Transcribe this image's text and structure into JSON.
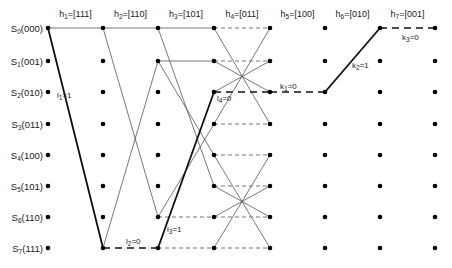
{
  "diagram": {
    "type": "trellis",
    "layout": {
      "columns_x": [
        48,
        103,
        158,
        214,
        270,
        325,
        380,
        435
      ],
      "rows_y": [
        28,
        61,
        92,
        124,
        155,
        186,
        217,
        248
      ],
      "stage_label_y": 14
    },
    "states": [
      {
        "sub": "0",
        "label_prefix": "S",
        "bits": "(000)"
      },
      {
        "sub": "1",
        "label_prefix": "S",
        "bits": "(001)"
      },
      {
        "sub": "2",
        "label_prefix": "S",
        "bits": "(010)"
      },
      {
        "sub": "3",
        "label_prefix": "S",
        "bits": "(011)"
      },
      {
        "sub": "4",
        "label_prefix": "S",
        "bits": "(100)"
      },
      {
        "sub": "5",
        "label_prefix": "S",
        "bits": "(101)"
      },
      {
        "sub": "6",
        "label_prefix": "S",
        "bits": "(110)"
      },
      {
        "sub": "7",
        "label_prefix": "S",
        "bits": "(111)"
      }
    ],
    "stages": [
      {
        "prefix": "h",
        "sub": "1",
        "value": "=[111]"
      },
      {
        "prefix": "h",
        "sub": "2",
        "value": "=[110]"
      },
      {
        "prefix": "h",
        "sub": "3",
        "value": "=[101]"
      },
      {
        "prefix": "h",
        "sub": "4",
        "value": "=[011]"
      },
      {
        "prefix": "h",
        "sub": "5",
        "value": "=[100]"
      },
      {
        "prefix": "h",
        "sub": "6",
        "value": "=[010]"
      },
      {
        "prefix": "h",
        "sub": "7",
        "value": "=[001]"
      }
    ],
    "nodes_present": [
      [
        0,
        1,
        2,
        3,
        4,
        5,
        6,
        7
      ],
      [
        0,
        1,
        2,
        3,
        4,
        5,
        6,
        7
      ],
      [
        0,
        1,
        2,
        3,
        4,
        5,
        6,
        7
      ],
      [
        0,
        1,
        2,
        3,
        4,
        5,
        6,
        7
      ],
      [
        0,
        1,
        2,
        3,
        4,
        5,
        6,
        7
      ],
      [
        0,
        1,
        2,
        3,
        4,
        5,
        6,
        7
      ],
      [
        0,
        1,
        2,
        3,
        4,
        5,
        6,
        7
      ],
      [
        0,
        1,
        2,
        3,
        4,
        5,
        6,
        7
      ]
    ],
    "edges": [
      {
        "stage": 0,
        "from": 0,
        "to": 0,
        "style": "solid"
      },
      {
        "stage": 0,
        "from": 0,
        "to": 7,
        "style": "bold-solid"
      },
      {
        "stage": 1,
        "from": 0,
        "to": 0,
        "style": "solid"
      },
      {
        "stage": 1,
        "from": 0,
        "to": 6,
        "style": "solid"
      },
      {
        "stage": 1,
        "from": 7,
        "to": 1,
        "style": "solid"
      },
      {
        "stage": 1,
        "from": 7,
        "to": 7,
        "style": "bold-dashed"
      },
      {
        "stage": 2,
        "from": 0,
        "to": 0,
        "style": "solid"
      },
      {
        "stage": 2,
        "from": 0,
        "to": 5,
        "style": "solid"
      },
      {
        "stage": 2,
        "from": 1,
        "to": 1,
        "style": "solid"
      },
      {
        "stage": 2,
        "from": 1,
        "to": 4,
        "style": "solid"
      },
      {
        "stage": 2,
        "from": 6,
        "to": 6,
        "style": "dashed"
      },
      {
        "stage": 2,
        "from": 6,
        "to": 3,
        "style": "solid"
      },
      {
        "stage": 2,
        "from": 7,
        "to": 7,
        "style": "dashed"
      },
      {
        "stage": 2,
        "from": 7,
        "to": 2,
        "style": "bold-solid"
      },
      {
        "stage": 3,
        "from": 0,
        "to": 0,
        "style": "dashed"
      },
      {
        "stage": 3,
        "from": 0,
        "to": 3,
        "style": "solid"
      },
      {
        "stage": 3,
        "from": 1,
        "to": 1,
        "style": "dashed"
      },
      {
        "stage": 3,
        "from": 1,
        "to": 2,
        "style": "solid"
      },
      {
        "stage": 3,
        "from": 2,
        "to": 2,
        "style": "bold-dashed"
      },
      {
        "stage": 3,
        "from": 2,
        "to": 1,
        "style": "solid"
      },
      {
        "stage": 3,
        "from": 3,
        "to": 3,
        "style": "dashed"
      },
      {
        "stage": 3,
        "from": 3,
        "to": 0,
        "style": "solid"
      },
      {
        "stage": 3,
        "from": 4,
        "to": 4,
        "style": "dashed"
      },
      {
        "stage": 3,
        "from": 4,
        "to": 7,
        "style": "solid"
      },
      {
        "stage": 3,
        "from": 5,
        "to": 5,
        "style": "dashed"
      },
      {
        "stage": 3,
        "from": 5,
        "to": 6,
        "style": "solid"
      },
      {
        "stage": 3,
        "from": 6,
        "to": 6,
        "style": "dashed"
      },
      {
        "stage": 3,
        "from": 6,
        "to": 5,
        "style": "solid"
      },
      {
        "stage": 3,
        "from": 7,
        "to": 7,
        "style": "dashed"
      },
      {
        "stage": 3,
        "from": 7,
        "to": 4,
        "style": "solid"
      },
      {
        "stage": 4,
        "from": 2,
        "to": 2,
        "style": "bold-dashed"
      },
      {
        "stage": 5,
        "from": 2,
        "to": 0,
        "style": "bold-solid"
      },
      {
        "stage": 6,
        "from": 0,
        "to": 0,
        "style": "bold-dashed"
      }
    ],
    "path_labels": [
      {
        "prefix": "l",
        "sub": "1",
        "value": "=1",
        "x": 57,
        "y": 98
      },
      {
        "prefix": "l",
        "sub": "2",
        "value": "=0",
        "x": 126,
        "y": 244
      },
      {
        "prefix": "l",
        "sub": "3",
        "value": "=1",
        "x": 167,
        "y": 232
      },
      {
        "prefix": "l",
        "sub": "4",
        "value": "=0",
        "x": 217,
        "y": 101
      },
      {
        "prefix": "k",
        "sub": "1",
        "value": "=0",
        "x": 280,
        "y": 89
      },
      {
        "prefix": "k",
        "sub": "2",
        "value": "=1",
        "x": 352,
        "y": 68
      },
      {
        "prefix": "k",
        "sub": "3",
        "value": "=0",
        "x": 402,
        "y": 40
      }
    ]
  }
}
